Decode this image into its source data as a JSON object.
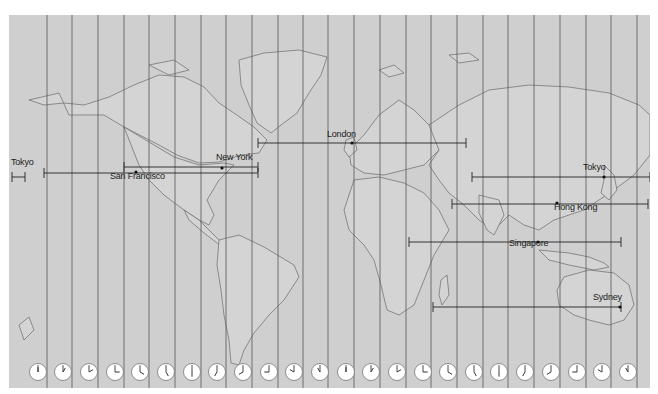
{
  "map": {
    "type": "world-time-zones",
    "projection": "mercator",
    "colors": {
      "background": "#cfcfcf",
      "zone_line": "#555555",
      "coast": "#666666",
      "route_line": "#222222",
      "page": "#ffffff",
      "clock_face": "#ffffff"
    },
    "zone_lines_x": [
      47,
      72,
      98,
      124,
      149,
      175,
      201,
      226,
      252,
      278,
      303,
      328,
      354,
      380,
      406,
      431,
      457,
      483,
      508,
      534,
      560,
      586,
      611,
      637
    ],
    "cities": [
      {
        "name": "Tokyo",
        "label": "Tokyo",
        "label_x": 11,
        "label_y": 162,
        "dot_x": null,
        "dot_y": null
      },
      {
        "name": "San Francisco",
        "label": "San Francisco",
        "label_x": 110,
        "label_y": 176,
        "dot_x": 136,
        "dot_y": 172
      },
      {
        "name": "New York",
        "label": "New York",
        "label_x": 216,
        "label_y": 157,
        "dot_x": 222,
        "dot_y": 168
      },
      {
        "name": "London",
        "label": "London",
        "label_x": 327,
        "label_y": 134,
        "dot_x": 352,
        "dot_y": 143
      },
      {
        "name": "Tokyo",
        "label": "Tokyo",
        "label_x": 583,
        "label_y": 167,
        "dot_x": 604,
        "dot_y": 177
      },
      {
        "name": "Hong Kong",
        "label": "Hong Kong",
        "label_x": 554,
        "label_y": 207,
        "dot_x": 557,
        "dot_y": 203
      },
      {
        "name": "Singapore",
        "label": "Singapore",
        "label_x": 509,
        "label_y": 243,
        "dot_x": 538,
        "dot_y": 242
      },
      {
        "name": "Sydney",
        "label": "Sydney",
        "label_x": 593,
        "label_y": 297,
        "dot_x": 620,
        "dot_y": 307
      }
    ],
    "routes": [
      {
        "name": "new-york-london",
        "x1": 258,
        "x2": 466,
        "y": 143
      },
      {
        "name": "san-francisco-new-york",
        "x1": 124,
        "x2": 258,
        "y": 167
      },
      {
        "name": "tokyo-wrap-left",
        "x1": 12,
        "x2": 25,
        "y": 177
      },
      {
        "name": "tokyo-san-francisco",
        "x1": 44,
        "x2": 258,
        "y": 173
      },
      {
        "name": "london-tokyo",
        "x1": 472,
        "x2": 650,
        "y": 177
      },
      {
        "name": "hong-kong",
        "x1": 452,
        "x2": 648,
        "y": 204
      },
      {
        "name": "singapore",
        "x1": 409,
        "x2": 621,
        "y": 242
      },
      {
        "name": "sydney",
        "x1": 433,
        "x2": 621,
        "y": 307
      }
    ],
    "clocks": [
      {
        "hour": 12,
        "minute": 0
      },
      {
        "hour": 1,
        "minute": 0
      },
      {
        "hour": 2,
        "minute": 0
      },
      {
        "hour": 3,
        "minute": 0
      },
      {
        "hour": 4,
        "minute": 0
      },
      {
        "hour": 5,
        "minute": 0
      },
      {
        "hour": 6,
        "minute": 0
      },
      {
        "hour": 7,
        "minute": 0
      },
      {
        "hour": 8,
        "minute": 0
      },
      {
        "hour": 9,
        "minute": 0
      },
      {
        "hour": 10,
        "minute": 0
      },
      {
        "hour": 11,
        "minute": 0
      },
      {
        "hour": 12,
        "minute": 0
      },
      {
        "hour": 1,
        "minute": 0
      },
      {
        "hour": 2,
        "minute": 0
      },
      {
        "hour": 3,
        "minute": 0
      },
      {
        "hour": 4,
        "minute": 0
      },
      {
        "hour": 5,
        "minute": 0
      },
      {
        "hour": 6,
        "minute": 0
      },
      {
        "hour": 7,
        "minute": 0
      },
      {
        "hour": 8,
        "minute": 0
      },
      {
        "hour": 9,
        "minute": 0
      },
      {
        "hour": 10,
        "minute": 0
      },
      {
        "hour": 11,
        "minute": 0
      }
    ],
    "clock_x": [
      38,
      63,
      89,
      115,
      140,
      166,
      192,
      217,
      243,
      269,
      294,
      320,
      346,
      371,
      397,
      423,
      448,
      474,
      499,
      525,
      551,
      577,
      602,
      628
    ],
    "clock_y": 372
  }
}
